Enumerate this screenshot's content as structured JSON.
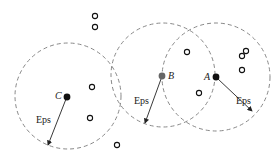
{
  "diagram": {
    "colors": {
      "circle": "#888888",
      "filled": "#111111",
      "filled_b": "#666666",
      "hollow": "#111111",
      "arrow": "#222222"
    },
    "neighborhoods": [
      {
        "id": "C",
        "cx": 68,
        "cy": 96,
        "r": 53
      },
      {
        "id": "B",
        "cx": 163,
        "cy": 75,
        "r": 52
      },
      {
        "id": "A",
        "cx": 216,
        "cy": 77,
        "r": 54
      }
    ],
    "labeled_points": [
      {
        "label": "C",
        "x": 67,
        "y": 97,
        "color": "#111111",
        "lx": 55,
        "ly": 99
      },
      {
        "label": "B",
        "x": 162,
        "y": 76,
        "color": "#666666",
        "lx": 168,
        "ly": 79
      },
      {
        "label": "A",
        "x": 216,
        "y": 77,
        "color": "#111111",
        "lx": 204,
        "ly": 80
      }
    ],
    "eps_arrows": [
      {
        "from": [
          66,
          99
        ],
        "to": [
          48,
          145
        ],
        "label": "Eps",
        "lx": 36,
        "ly": 123
      },
      {
        "from": [
          161,
          79
        ],
        "to": [
          145,
          123
        ],
        "label": "Eps",
        "lx": 134,
        "ly": 104
      },
      {
        "from": [
          218,
          79
        ],
        "to": [
          252,
          111
        ],
        "label": "Eps",
        "lx": 236,
        "ly": 104
      }
    ],
    "hollow_points": [
      [
        95,
        16
      ],
      [
        95,
        27
      ],
      [
        92,
        87
      ],
      [
        90,
        118
      ],
      [
        117,
        145
      ],
      [
        199,
        93
      ],
      [
        187,
        52
      ],
      [
        199,
        93
      ],
      [
        246,
        51
      ],
      [
        242,
        56
      ],
      [
        242,
        70
      ]
    ],
    "labels": {
      "eps": "Eps",
      "a": "A",
      "b": "B",
      "c": "C"
    }
  }
}
